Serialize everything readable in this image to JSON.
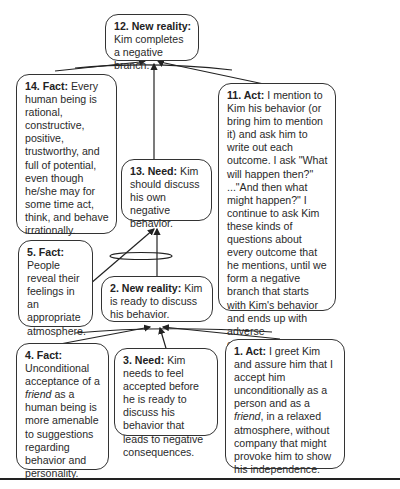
{
  "diagram": {
    "type": "sufficiency-cause-effect-tree",
    "nodes": [
      {
        "id": "12",
        "type": "New reality",
        "label": "12. New reality:",
        "text": "Kim completes a negative branch."
      },
      {
        "id": "14",
        "type": "Fact",
        "label": "14. Fact:",
        "text": "Every human being is rational, constructive, positive, trustworthy, and full of potential, even though he/she may for some time act, think, and behave irrationally."
      },
      {
        "id": "11",
        "type": "Act",
        "label": "11. Act:",
        "text": "I mention to Kim his behavior (or bring him to mention it) and ask him to write out each outcome. I ask \"What will happen then?\" ...\"And then what might happen?\" I continue to ask Kim these kinds of questions about every outcome that he mentions, until we form a negative branch that starts with Kim's behavior and ends up with adverse consequences for Kim."
      },
      {
        "id": "13",
        "type": "Need",
        "label": "13. Need:",
        "text": "Kim should discuss his own negative behavior."
      },
      {
        "id": "5",
        "type": "Fact",
        "label": "5. Fact:",
        "text": "People reveal their feelings in an appropriate atmosphere."
      },
      {
        "id": "2",
        "type": "New reality",
        "label": "2. New reality:",
        "text": "Kim is ready to discuss his behavior."
      },
      {
        "id": "4",
        "type": "Fact",
        "label": "4. Fact:",
        "text_pre": "Unconditional acceptance of a ",
        "text_italic": "friend",
        "text_post": " as a human being is more amenable to suggestions regarding behavior and personality."
      },
      {
        "id": "3",
        "type": "Need",
        "label": "3. Need:",
        "text": "Kim needs to feel accepted before he is ready to discuss his behavior that leads to negative consequences."
      },
      {
        "id": "1",
        "type": "Act",
        "label": "1. Act:",
        "text_pre": "I greet Kim and assure him that I accept him unconditionally as a person and as a ",
        "text_italic": "friend",
        "text_post": ", in a relaxed atmosphere, without company that might provoke him to show his independence."
      }
    ],
    "edges": [
      {
        "from": [
          "4",
          "3",
          "1"
        ],
        "to": "2",
        "logic": "and"
      },
      {
        "from": [
          "5",
          "2"
        ],
        "to": "13",
        "logic": "and"
      },
      {
        "from": [
          "14",
          "13",
          "11"
        ],
        "to": "12",
        "logic": "and"
      }
    ]
  }
}
